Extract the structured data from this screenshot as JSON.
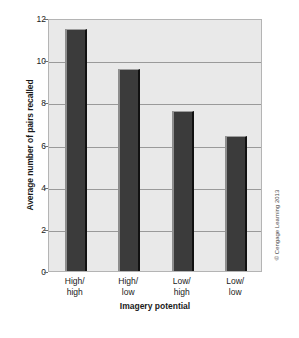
{
  "chart_data": {
    "type": "bar",
    "title": "",
    "xlabel": "Imagery potential",
    "ylabel": "Average number of pairs recalled",
    "categories": [
      "High/\nhigh",
      "High/\nlow",
      "Low/\nhigh",
      "Low/\nlow"
    ],
    "category_lines": [
      [
        "High/",
        "high"
      ],
      [
        "High/",
        "low"
      ],
      [
        "Low/",
        "high"
      ],
      [
        "Low/",
        "low"
      ]
    ],
    "values": [
      11.5,
      9.6,
      7.6,
      6.4
    ],
    "ylim": [
      0,
      12
    ],
    "yticks": [
      0,
      2,
      4,
      6,
      8,
      10,
      12
    ],
    "ytick_labels": [
      "0",
      "2",
      "4",
      "6",
      "8",
      "10",
      "12"
    ],
    "grid": "horizontal",
    "legend": "none",
    "bar_color": "#3b3b3b",
    "plot_background": "#e9e9e9",
    "gridline_color": "#9a9a9a"
  },
  "annotations": {
    "copyright": "© Cengage Learning 2013"
  }
}
